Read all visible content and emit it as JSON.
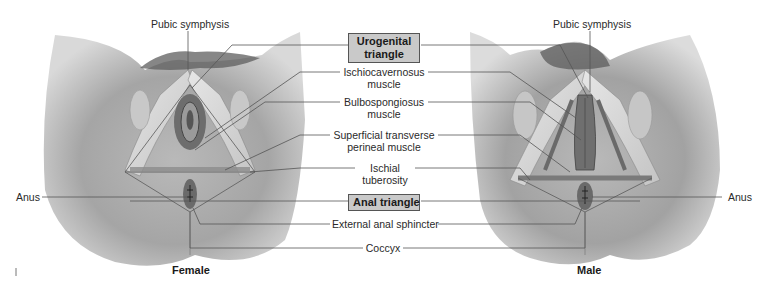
{
  "figure": {
    "panels": [
      {
        "id": "female",
        "caption": "Female"
      },
      {
        "id": "male",
        "caption": "Male"
      }
    ],
    "region_boxes": {
      "urogenital": "Urogenital\ntriangle",
      "urogenital_line1": "Urogenital",
      "urogenital_line2": "triangle",
      "anal": "Anal triangle"
    },
    "labels": {
      "pubic_symphysis_female": "Pubic symphysis",
      "pubic_symphysis_male": "Pubic symphysis",
      "ischiocavernosus_1": "Ischiocavernosus",
      "ischiocavernosus_2": "muscle",
      "bulbospongiosus_1": "Bulbospongiosus",
      "bulbospongiosus_2": "muscle",
      "superficial_transverse_1": "Superficial transverse",
      "superficial_transverse_2": "perineal muscle",
      "ischial_1": "Ischial",
      "ischial_2": "tuberosity",
      "external_anal_sphincter": "External anal sphincter",
      "coccyx": "Coccyx",
      "anus_female": "Anus",
      "anus_male": "Anus"
    },
    "colors": {
      "box_fill": "#c9c9c9",
      "box_border": "#555555",
      "leader_line": "#555555",
      "skin_dark": "#8a8a8a",
      "skin_light": "#d8d8d8"
    }
  }
}
